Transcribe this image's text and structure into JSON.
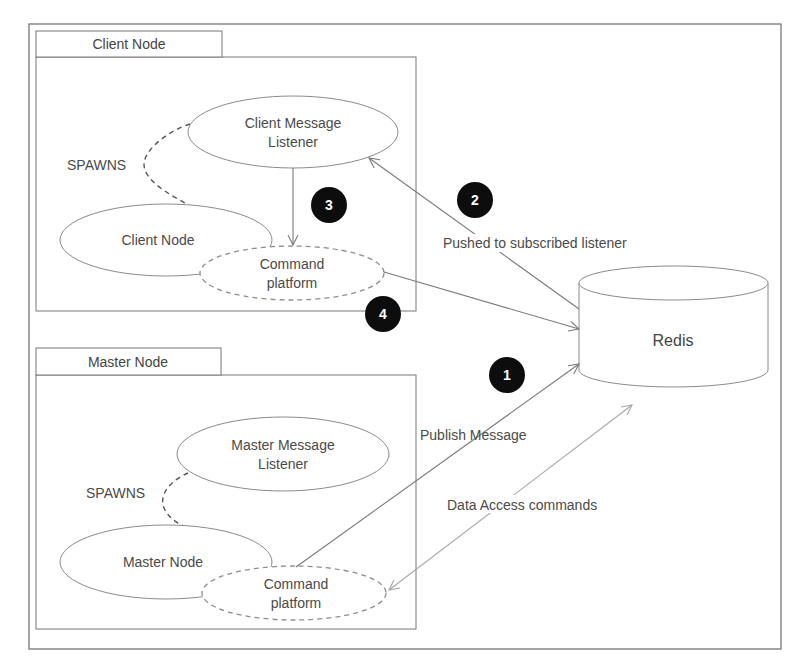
{
  "diagram": {
    "client_node_group": {
      "tab_label": "Client Node",
      "listener_label_line1": "Client Message",
      "listener_label_line2": "Listener",
      "node_label": "Client Node",
      "command_label_line1": "Command",
      "command_label_line2": "platform",
      "spawns_label": "SPAWNS"
    },
    "master_node_group": {
      "tab_label": "Master Node",
      "listener_label_line1": "Master Message",
      "listener_label_line2": "Listener",
      "node_label": "Master Node",
      "command_label_line1": "Command",
      "command_label_line2": "platform",
      "spawns_label": "SPAWNS"
    },
    "redis": {
      "label": "Redis"
    },
    "edges": [
      {
        "step": "1",
        "label": "Publish Message",
        "from": "Master Command platform",
        "to": "Redis"
      },
      {
        "step": "2",
        "label": "Pushed to subscribed listener",
        "from": "Redis",
        "to": "Client Message Listener"
      },
      {
        "step": "3",
        "label": "",
        "from": "Client Message Listener",
        "to": "Client Command platform"
      },
      {
        "step": "4",
        "label": "",
        "from": "Client Command platform",
        "to": "Redis"
      },
      {
        "step": "",
        "label": "Data Access commands",
        "from": "Master Command platform",
        "to": "Redis",
        "bidirectional": true
      }
    ],
    "colors": {
      "badge": "#0d0d0d",
      "line": "#7a7a7a",
      "text": "#4a4a4a"
    }
  }
}
